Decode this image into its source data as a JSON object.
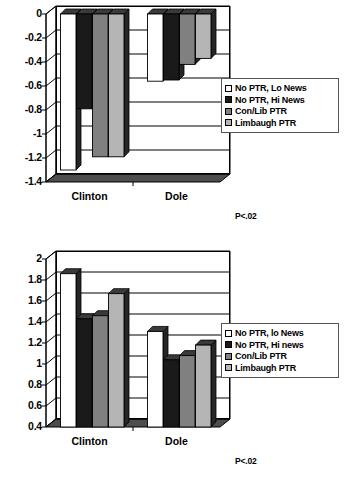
{
  "figure": {
    "charts": [
      {
        "id": "chart-top",
        "pvalue": "P<.02",
        "legend": [
          {
            "label": "No PTR, Lo News",
            "color": "#ffffff"
          },
          {
            "label": "No PTR, Hi News",
            "color": "#1a1a1a"
          },
          {
            "label": "Con/Lib PTR",
            "color": "#808080"
          },
          {
            "label": "Limbaugh PTR",
            "color": "#b5b5b5"
          }
        ],
        "chart_data": {
          "type": "bar",
          "title": "",
          "xlabel": "",
          "ylabel": "",
          "categories": [
            "Clinton",
            "Dole"
          ],
          "ylim": [
            -1.4,
            0
          ],
          "yticks": [
            "0",
            "-0.2",
            "-0.4",
            "-0.6",
            "-0.8",
            "-1",
            "-1.2",
            "-1.4"
          ],
          "grid": true,
          "legend_position": "right",
          "series": [
            {
              "name": "No PTR, Lo News",
              "color": "#ffffff",
              "values": [
                -1.3,
                -0.56
              ]
            },
            {
              "name": "No PTR, Hi News",
              "color": "#1a1a1a",
              "values": [
                -0.79,
                -0.55
              ]
            },
            {
              "name": "Con/Lib PTR",
              "color": "#808080",
              "values": [
                -1.19,
                -0.42
              ]
            },
            {
              "name": "Limbaugh PTR",
              "color": "#b5b5b5",
              "values": [
                -1.19,
                -0.37
              ]
            }
          ],
          "annotation": "P<.02"
        }
      },
      {
        "id": "chart-bottom",
        "pvalue": "P<.02",
        "legend": [
          {
            "label": "No PTR, lo News",
            "color": "#ffffff"
          },
          {
            "label": "No PTR, Hi news",
            "color": "#1a1a1a"
          },
          {
            "label": "Con/Lib PTR",
            "color": "#808080"
          },
          {
            "label": "Limbaugh PTR",
            "color": "#b5b5b5"
          }
        ],
        "chart_data": {
          "type": "bar",
          "title": "",
          "xlabel": "",
          "ylabel": "",
          "categories": [
            "Clinton",
            "Dole"
          ],
          "ylim": [
            0.4,
            2
          ],
          "yticks": [
            "2",
            "1.8",
            "1.6",
            "1.4",
            "1.2",
            "1",
            "0.8",
            "0.6",
            "0.4"
          ],
          "grid": true,
          "legend_position": "right",
          "series": [
            {
              "name": "No PTR, lo News",
              "color": "#ffffff",
              "values": [
                1.86,
                1.31
              ]
            },
            {
              "name": "No PTR, Hi news",
              "color": "#1a1a1a",
              "values": [
                1.43,
                1.04
              ]
            },
            {
              "name": "Con/Lib PTR",
              "color": "#808080",
              "values": [
                1.46,
                1.08
              ]
            },
            {
              "name": "Limbaugh PTR",
              "color": "#b5b5b5",
              "values": [
                1.67,
                1.18
              ]
            }
          ],
          "annotation": "P<.02"
        }
      }
    ]
  }
}
